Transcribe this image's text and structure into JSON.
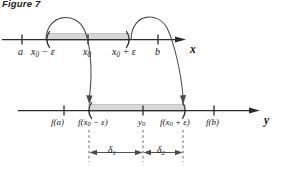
{
  "figure": {
    "caption": "Figure 7",
    "background_color": "#ffffff",
    "line_color": "#2b2b2b",
    "band_color": "#d6d6d6",
    "band_edge_color": "#9a9a9a"
  },
  "x_axis": {
    "name": "x",
    "ticks": [
      {
        "id": "a",
        "label": "a",
        "label_html": "a"
      },
      {
        "id": "x0-minus-eps",
        "label": "x0 − ε",
        "label_html": "x<span class=\"sub\">0</span> − ε"
      },
      {
        "id": "x0",
        "label": "x0",
        "label_html": "x<span class=\"sub\">0</span>"
      },
      {
        "id": "x0-plus-eps",
        "label": "x0 + ε",
        "label_html": "x<span class=\"sub\">0</span> + ε"
      },
      {
        "id": "b",
        "label": "b",
        "label_html": "b"
      }
    ],
    "interval_open_left": "(",
    "interval_open_right": ")"
  },
  "y_axis": {
    "name": "y",
    "ticks": [
      {
        "id": "f-a",
        "label": "f(a)",
        "label_html": "f(a)"
      },
      {
        "id": "f-x0-minus-eps",
        "label": "f(x0 − ε)",
        "label_html": "f(x<span class=\"sub\">0</span> − ε)"
      },
      {
        "id": "y0",
        "label": "y0",
        "label_html": "y<span class=\"sub\">0</span>"
      },
      {
        "id": "f-x0-plus-eps",
        "label": "f(x0 + ε)",
        "label_html": "f(x<span class=\"sub\">0</span> + ε)"
      },
      {
        "id": "f-b",
        "label": "f(b)",
        "label_html": "f(b)"
      }
    ],
    "interval_open_left": "(",
    "interval_open_right": ")"
  },
  "deltas": [
    {
      "id": "delta1",
      "label": "δ1",
      "label_html": "&delta;<span class=\"sub\">1</span>"
    },
    {
      "id": "delta2",
      "label": "δ2",
      "label_html": "&delta;<span class=\"sub\">2</span>"
    }
  ],
  "mapping_arrows": [
    {
      "id": "arrow-left",
      "from": "x0 − ε",
      "to": "f(x0 − ε)"
    },
    {
      "id": "arrow-right",
      "from": "x0 + ε",
      "to": "f(x0 + ε)"
    }
  ]
}
